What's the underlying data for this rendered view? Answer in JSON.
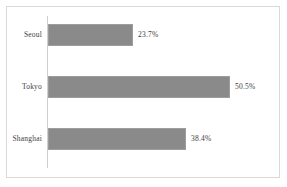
{
  "chart_data": {
    "type": "bar",
    "orientation": "horizontal",
    "title": "",
    "subtitle": "",
    "xlabel": "",
    "ylabel": "",
    "grid": false,
    "legend": false,
    "legend_position": "none",
    "xlim": [
      0,
      55
    ],
    "categories": [
      "Seoul",
      "Tokyo",
      "Shanghai"
    ],
    "values": [
      23.7,
      50.5,
      38.4
    ],
    "value_labels": [
      "23.7%",
      "50.5%",
      "38.4%"
    ],
    "bars": [
      {
        "category": "Seoul",
        "value": 23.7,
        "label": "23.7%"
      },
      {
        "category": "Tokyo",
        "value": 50.5,
        "label": "50.5%"
      },
      {
        "category": "Shanghai",
        "value": 38.4,
        "label": "38.4%"
      }
    ]
  },
  "style": {
    "bar_color": "#8a8a8a",
    "bar_border_color": "#9d9d9d",
    "frame_border_color": "#d9d9d9",
    "axis_line_color": "#cfcfcf",
    "text_color": "#3d3d3d",
    "background": "#ffffff"
  }
}
